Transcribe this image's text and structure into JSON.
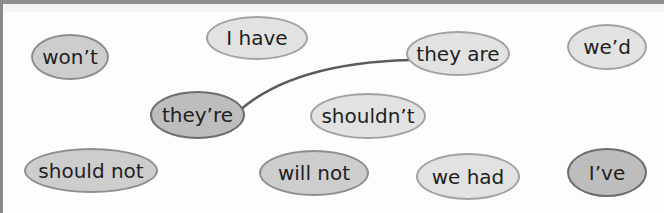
{
  "diagram": {
    "nodes": [
      {
        "id": "wont",
        "label": "won’t"
      },
      {
        "id": "i_have",
        "label": "I have"
      },
      {
        "id": "they_are",
        "label": "they are"
      },
      {
        "id": "wed",
        "label": "we’d"
      },
      {
        "id": "theyre",
        "label": "they’re"
      },
      {
        "id": "shouldnt",
        "label": "shouldn’t"
      },
      {
        "id": "should_not",
        "label": "should not"
      },
      {
        "id": "will_not",
        "label": "will not"
      },
      {
        "id": "we_had",
        "label": "we had"
      },
      {
        "id": "ive",
        "label": "I’ve"
      }
    ],
    "connections": [
      {
        "from": "theyre",
        "to": "they_are"
      }
    ],
    "colors": {
      "line": "#5a5a5a",
      "oval_light": "#e2e2e2",
      "oval_dark": "#bdbdbd",
      "text": "#1f1f1f"
    }
  }
}
